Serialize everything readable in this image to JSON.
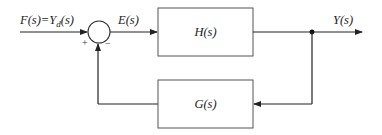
{
  "diagram": {
    "type": "feedback-control-block-diagram",
    "input_label": "F(s)=Y",
    "input_label_subscript": "d",
    "input_label_suffix": "(s)",
    "error_label": "E(s)",
    "output_label": "Y(s)",
    "forward_block": {
      "label": "H(s)"
    },
    "feedback_block": {
      "label": "G(s)"
    },
    "summing_junction": {
      "plus_sign": "+",
      "minus_sign": "−"
    },
    "colors": {
      "line": "#222222",
      "box_border": "#555555",
      "background": "#ffffff"
    }
  }
}
